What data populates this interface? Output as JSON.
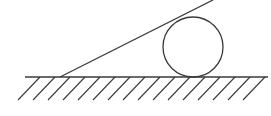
{
  "diagram": {
    "type": "physics-mechanics",
    "colors": {
      "stroke": "#3a3a3a",
      "background": "#ffffff"
    },
    "ground": {
      "x1": 25,
      "y": 77,
      "x2": 268,
      "hatch_spacing": 15,
      "hatch_length_dx": -22,
      "hatch_length_dy": 23
    },
    "incline": {
      "x1": 60,
      "y1": 77,
      "x2": 213,
      "y2": 0
    },
    "circle": {
      "cx": 193,
      "cy": 47,
      "r": 30
    },
    "labels": []
  }
}
